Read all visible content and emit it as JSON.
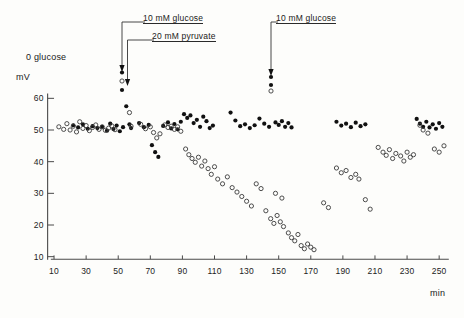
{
  "figure": {
    "caption_labels": {
      "zero_glucose": "0 glucose",
      "annotation_1_line1": "10 mM glucose",
      "annotation_1_line2": "20 mM pyruvate",
      "annotation_2_line1": "10 mM glucose"
    }
  },
  "chart_data": {
    "type": "scatter",
    "title": "",
    "xlabel": "min",
    "ylabel": "mV",
    "xlim": [
      0,
      258
    ],
    "ylim": [
      8,
      62
    ],
    "grid": false,
    "legend_position": "none",
    "xticks": [
      10,
      30,
      50,
      70,
      90,
      110,
      130,
      150,
      170,
      190,
      210,
      230,
      250
    ],
    "yticks": [
      10,
      20,
      30,
      40,
      50,
      60
    ],
    "annotations": [
      {
        "text": "0 glucose",
        "x": 22,
        "y": 57,
        "type": "text"
      },
      {
        "text": "10 mM glucose",
        "x": 60,
        "y": 61,
        "type": "arrow-label",
        "arrow_x": 57,
        "arrow_to_y": 52
      },
      {
        "text": "20 mM pyruvate",
        "x": 66,
        "y": 58,
        "type": "arrow-label",
        "arrow_x": 60,
        "arrow_to_y": 55
      },
      {
        "text": "10 mM glucose",
        "x": 150,
        "y": 61,
        "type": "arrow-label",
        "arrow_x": 147,
        "arrow_to_y": 53
      }
    ],
    "series": [
      {
        "name": "filled-circles",
        "marker": "filled",
        "color": "#111111",
        "points": [
          [
            22,
            51.5
          ],
          [
            25,
            50.8
          ],
          [
            28,
            51.8
          ],
          [
            31,
            50.4
          ],
          [
            34,
            51.2
          ],
          [
            37,
            50.6
          ],
          [
            40,
            51.0
          ],
          [
            43,
            49.8
          ],
          [
            45,
            52.0
          ],
          [
            47,
            50.3
          ],
          [
            49,
            51.4
          ],
          [
            51,
            49.6
          ],
          [
            53,
            50.9
          ],
          [
            55,
            57.5
          ],
          [
            57,
            51.8
          ],
          [
            58,
            50.6
          ],
          [
            63,
            52.2
          ],
          [
            66,
            50.9
          ],
          [
            69,
            51.6
          ],
          [
            71,
            45.2
          ],
          [
            73,
            43.0
          ],
          [
            75,
            41.5
          ],
          [
            78,
            51.3
          ],
          [
            81,
            52.4
          ],
          [
            83,
            50.5
          ],
          [
            85,
            51.9
          ],
          [
            87,
            50.2
          ],
          [
            89,
            52.6
          ],
          [
            91,
            55.0
          ],
          [
            93,
            53.8
          ],
          [
            95,
            54.6
          ],
          [
            97,
            52.2
          ],
          [
            99,
            53.2
          ],
          [
            101,
            51.0
          ],
          [
            103,
            54.2
          ],
          [
            105,
            52.8
          ],
          [
            107,
            50.6
          ],
          [
            109,
            51.4
          ],
          [
            120,
            55.5
          ],
          [
            123,
            53.0
          ],
          [
            126,
            51.2
          ],
          [
            129,
            51.8
          ],
          [
            132,
            50.6
          ],
          [
            135,
            51.5
          ],
          [
            138,
            53.6
          ],
          [
            141,
            52.0
          ],
          [
            144,
            51.0
          ],
          [
            148,
            52.4
          ],
          [
            150,
            51.6
          ],
          [
            152,
            52.8
          ],
          [
            154,
            51.0
          ],
          [
            156,
            52.2
          ],
          [
            158,
            50.8
          ],
          [
            186,
            52.6
          ],
          [
            189,
            51.4
          ],
          [
            192,
            52.0
          ],
          [
            195,
            50.9
          ],
          [
            198,
            52.3
          ],
          [
            201,
            51.2
          ],
          [
            204,
            51.8
          ],
          [
            236,
            53.5
          ],
          [
            238,
            52.0
          ],
          [
            240,
            51.0
          ],
          [
            242,
            52.6
          ],
          [
            244,
            50.8
          ],
          [
            246,
            51.8
          ],
          [
            248,
            50.4
          ],
          [
            250,
            52.2
          ],
          [
            252,
            51.0
          ]
        ]
      },
      {
        "name": "open-circles",
        "marker": "open",
        "color": "#3a3a3a",
        "points": [
          [
            13,
            51.0
          ],
          [
            16,
            50.2
          ],
          [
            18,
            52.0
          ],
          [
            20,
            50.0
          ],
          [
            22,
            51.2
          ],
          [
            24,
            49.4
          ],
          [
            26,
            52.6
          ],
          [
            28,
            50.5
          ],
          [
            30,
            51.4
          ],
          [
            32,
            49.8
          ],
          [
            34,
            50.8
          ],
          [
            36,
            51.6
          ],
          [
            38,
            50.2
          ],
          [
            40,
            51.0
          ],
          [
            42,
            49.9
          ],
          [
            44,
            50.6
          ],
          [
            46,
            51.3
          ],
          [
            48,
            50.1
          ],
          [
            57,
            55.5
          ],
          [
            58,
            51.2
          ],
          [
            64,
            51.8
          ],
          [
            67,
            50.4
          ],
          [
            70,
            51.0
          ],
          [
            72,
            49.2
          ],
          [
            74,
            47.5
          ],
          [
            76,
            48.8
          ],
          [
            79,
            51.6
          ],
          [
            81,
            50.8
          ],
          [
            83,
            51.2
          ],
          [
            85,
            50.2
          ],
          [
            87,
            51.0
          ],
          [
            89,
            49.6
          ],
          [
            92,
            44.0
          ],
          [
            94,
            42.2
          ],
          [
            96,
            41.0
          ],
          [
            98,
            39.8
          ],
          [
            100,
            41.4
          ],
          [
            102,
            38.6
          ],
          [
            104,
            40.2
          ],
          [
            106,
            37.8
          ],
          [
            108,
            36.0
          ],
          [
            110,
            38.4
          ],
          [
            112,
            34.5
          ],
          [
            115,
            33.0
          ],
          [
            118,
            35.2
          ],
          [
            121,
            31.8
          ],
          [
            124,
            30.4
          ],
          [
            127,
            29.0
          ],
          [
            130,
            27.5
          ],
          [
            133,
            26.0
          ],
          [
            136,
            33.0
          ],
          [
            139,
            31.5
          ],
          [
            142,
            24.5
          ],
          [
            145,
            22.0
          ],
          [
            147,
            20.5
          ],
          [
            149,
            23.0
          ],
          [
            151,
            21.0
          ],
          [
            153,
            19.5
          ],
          [
            156,
            17.5
          ],
          [
            158,
            16.0
          ],
          [
            160,
            15.0
          ],
          [
            162,
            17.0
          ],
          [
            164,
            13.5
          ],
          [
            166,
            12.5
          ],
          [
            168,
            14.0
          ],
          [
            170,
            13.0
          ],
          [
            172,
            12.2
          ],
          [
            148,
            30.0
          ],
          [
            152,
            28.5
          ],
          [
            178,
            27.0
          ],
          [
            181,
            25.5
          ],
          [
            186,
            38.0
          ],
          [
            189,
            36.5
          ],
          [
            192,
            37.2
          ],
          [
            195,
            35.0
          ],
          [
            198,
            36.0
          ],
          [
            200,
            34.5
          ],
          [
            204,
            28.0
          ],
          [
            207,
            25.0
          ],
          [
            212,
            44.5
          ],
          [
            215,
            43.0
          ],
          [
            217,
            42.0
          ],
          [
            219,
            43.8
          ],
          [
            221,
            41.0
          ],
          [
            223,
            42.6
          ],
          [
            226,
            41.8
          ],
          [
            228,
            40.2
          ],
          [
            230,
            43.0
          ],
          [
            232,
            41.4
          ],
          [
            234,
            42.2
          ],
          [
            238,
            51.5
          ],
          [
            240,
            50.0
          ],
          [
            243,
            49.0
          ],
          [
            247,
            44.0
          ],
          [
            250,
            43.0
          ],
          [
            253,
            45.0
          ]
        ]
      }
    ]
  }
}
